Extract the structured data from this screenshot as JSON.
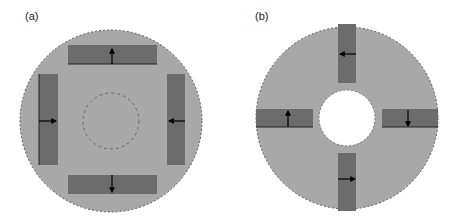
{
  "figure": {
    "panels": [
      {
        "label": "(a)",
        "description": "Disk with four magnet blocks, dashed inner circle",
        "colors": {
          "disk": "#a8a8a8",
          "block": "#6c6c6c",
          "edge": "#555555",
          "arrow": "#000000"
        },
        "blocks": [
          {
            "position": "top",
            "arrow": "up"
          },
          {
            "position": "left",
            "arrow": "right"
          },
          {
            "position": "right",
            "arrow": "left"
          },
          {
            "position": "bottom",
            "arrow": "down"
          }
        ]
      },
      {
        "label": "(b)",
        "description": "Annular disk with four magnet blocks around a central hole",
        "colors": {
          "disk": "#a8a8a8",
          "block": "#6c6c6c",
          "edge": "#555555",
          "arrow": "#000000",
          "hole": "#ffffff"
        },
        "blocks": [
          {
            "position": "top",
            "arrow": "left"
          },
          {
            "position": "left",
            "arrow": "up"
          },
          {
            "position": "right",
            "arrow": "down"
          },
          {
            "position": "bottom",
            "arrow": "right"
          }
        ]
      }
    ]
  }
}
